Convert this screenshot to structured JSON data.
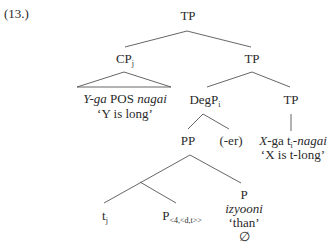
{
  "example_number": "(13.)",
  "tree": {
    "root": {
      "label": "TP"
    },
    "cp": {
      "label": "CP",
      "subscript": "j",
      "triangle_text": {
        "part1_italic": "Y-ga",
        "part2": " POS ",
        "part3_italic": "nagai"
      },
      "gloss": "‘Y is long’"
    },
    "tp_upper": {
      "label": "TP"
    },
    "degp": {
      "label": "DegP",
      "subscript": "i"
    },
    "tp_lower": {
      "label": "TP",
      "text": {
        "part1_italic": "X",
        "part2": "-ga t",
        "part2_sub": "i",
        "part3": "-",
        "part4_italic": "nagai"
      },
      "gloss": "‘X is t-long’"
    },
    "pp": {
      "label": "PP"
    },
    "er": {
      "label": "(-er)"
    },
    "trace": {
      "label": "t",
      "subscript": "j"
    },
    "p_type": {
      "label": "P",
      "subscript": "<4,<d,t>>"
    },
    "p_head": {
      "label": "P",
      "word_italic": "izyooni",
      "gloss": "‘than’",
      "null": "∅"
    }
  }
}
